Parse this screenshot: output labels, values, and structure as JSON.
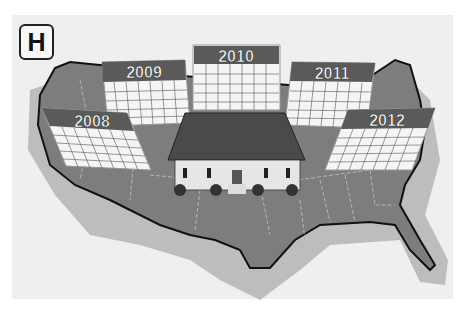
{
  "badge": {
    "label": "H"
  },
  "illustration": {
    "subject": "US map with house and calendar pages",
    "calendars": [
      {
        "year": "2008"
      },
      {
        "year": "2009"
      },
      {
        "year": "2010"
      },
      {
        "year": "2011"
      },
      {
        "year": "2012"
      }
    ],
    "colors": {
      "background": "#efefef",
      "map_fill": "#7d7d7d",
      "map_shadow": "#bdbdbd",
      "calendar_header": "#5a5a5a",
      "calendar_grid": "#ffffff",
      "roof": "#4a4a4a",
      "house_wall": "#e6e6e6"
    }
  }
}
